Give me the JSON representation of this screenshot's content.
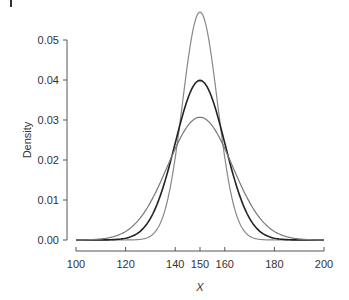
{
  "chart_data": {
    "type": "line",
    "title": "",
    "xlabel": "X",
    "ylabel": "Density",
    "xlim": [
      100,
      200
    ],
    "ylim": [
      0,
      0.05
    ],
    "x_ticks": [
      100,
      120,
      140,
      150,
      160,
      180,
      200
    ],
    "x_tick_labels": [
      "100",
      "120",
      "140",
      "150",
      "160",
      "180",
      "200"
    ],
    "y_ticks": [
      0,
      0.01,
      0.02,
      0.03,
      0.04,
      0.05
    ],
    "y_tick_labels": [
      "0.00",
      "0.01",
      "0.02",
      "0.03",
      "0.04",
      "0.05"
    ],
    "grid": false,
    "legend": null,
    "series": [
      {
        "name": "Normal(150, 7)",
        "mean": 150,
        "sd": 7,
        "peak": 0.057,
        "color": "#888888",
        "width": 1.2
      },
      {
        "name": "Normal(150, 10)",
        "mean": 150,
        "sd": 10,
        "peak": 0.04,
        "color": "#222222",
        "width": 1.6
      },
      {
        "name": "Normal(150, 13)",
        "mean": 150,
        "sd": 13,
        "peak": 0.031,
        "color": "#777777",
        "width": 1.2
      }
    ]
  }
}
